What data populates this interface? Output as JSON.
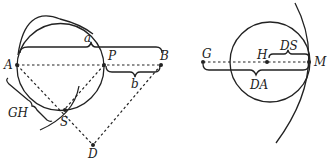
{
  "figure": {
    "left": {
      "points": {
        "A": "A",
        "P": "P",
        "B": "B",
        "S": "S",
        "D": "D"
      },
      "braces": {
        "a": "a",
        "b": "b",
        "GH": "GH"
      }
    },
    "right": {
      "points": {
        "G": "G",
        "H": "H",
        "M": "M"
      },
      "braces": {
        "DS": "DS",
        "DA": "DA"
      }
    },
    "colors": {
      "ink": "#222222"
    }
  }
}
